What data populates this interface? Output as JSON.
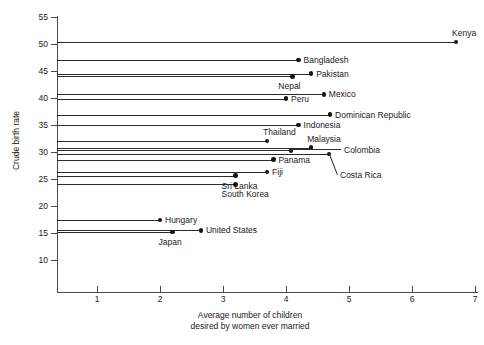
{
  "chart_data": {
    "type": "scatter",
    "title": "",
    "xlabel": "Average number of children desired by women ever married",
    "xlabel_line1": "Average number of children",
    "xlabel_line2": "desired by women ever married",
    "ylabel": "Crude birth rate",
    "xlim": [
      0.0,
      7.6
    ],
    "ylim": [
      10,
      55
    ],
    "xticks": [
      1,
      2,
      3,
      4,
      5,
      6,
      7
    ],
    "yticks": [
      10,
      15,
      20,
      25,
      30,
      35,
      40,
      45,
      50,
      55
    ],
    "grid": false,
    "legend": "none",
    "marker": "dot-with-horizontal-stem-to-y-axis",
    "points": [
      {
        "name": "Kenya",
        "x": 6.7,
        "y": 50.4,
        "label_pos": "above",
        "leader": false
      },
      {
        "name": "Bangladesh",
        "x": 4.2,
        "y": 47.0,
        "label_pos": "right",
        "leader": false
      },
      {
        "name": "Pakistan",
        "x": 4.4,
        "y": 44.5,
        "label_pos": "right",
        "leader": false
      },
      {
        "name": "Nepal",
        "x": 4.1,
        "y": 44.0,
        "label_pos": "below",
        "leader": false
      },
      {
        "name": "Mexico",
        "x": 4.6,
        "y": 40.7,
        "label_pos": "right",
        "leader": false
      },
      {
        "name": "Peru",
        "x": 4.0,
        "y": 39.9,
        "label_pos": "right",
        "leader": false
      },
      {
        "name": "Dominican Republic",
        "x": 4.7,
        "y": 36.9,
        "label_pos": "right",
        "leader": false
      },
      {
        "name": "Indonesia",
        "x": 4.2,
        "y": 35.0,
        "label_pos": "right",
        "leader": false
      },
      {
        "name": "Thailand",
        "x": 3.7,
        "y": 32.0,
        "label_pos": "above",
        "leader": false
      },
      {
        "name": "Malaysia",
        "x": 4.4,
        "y": 30.8,
        "label_pos": "above",
        "leader": false
      },
      {
        "name": "Colombia",
        "x": 4.08,
        "y": 30.3,
        "label_pos": "leader",
        "leader": true
      },
      {
        "name": "Costa Rica",
        "x": 4.68,
        "y": 29.6,
        "label_pos": "leader",
        "leader": true
      },
      {
        "name": "Panama",
        "x": 3.8,
        "y": 28.6,
        "label_pos": "right",
        "leader": false
      },
      {
        "name": "Fiji",
        "x": 3.7,
        "y": 26.3,
        "label_pos": "right",
        "leader": false
      },
      {
        "name": "Sri Lanka",
        "x": 3.2,
        "y": 25.6,
        "label_pos": "below",
        "leader": false
      },
      {
        "name": "South Korea",
        "x": 3.2,
        "y": 24.0,
        "label_pos": "below",
        "leader": false
      },
      {
        "name": "Hungary",
        "x": 2.0,
        "y": 17.4,
        "label_pos": "right",
        "leader": false
      },
      {
        "name": "United States",
        "x": 2.65,
        "y": 15.5,
        "label_pos": "right",
        "leader": false
      },
      {
        "name": "Japan",
        "x": 2.2,
        "y": 15.2,
        "label_pos": "below",
        "leader": false
      }
    ]
  },
  "colors": {
    "axis": "#4a4a4a",
    "stem": "#2b2b2b",
    "dot": "#141414",
    "text": "#1a1a1a",
    "background": "#ffffff"
  }
}
